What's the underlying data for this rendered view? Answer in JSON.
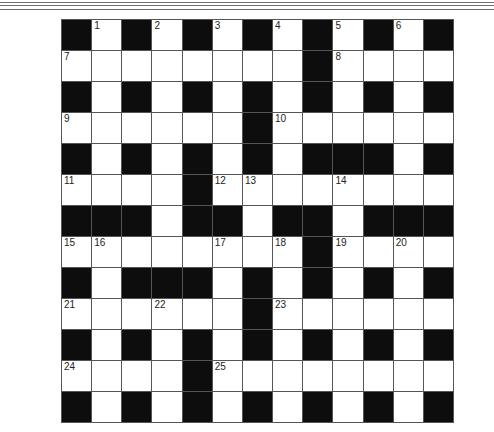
{
  "puzzle": {
    "rows": 13,
    "cols": 13,
    "block_color": "#0d0d0d",
    "cell_color": "#ffffff",
    "line_color": "#555555",
    "layout": [
      "#.#.#.#.#.#.#",
      "........#....",
      "#.#.#.#.#.#.#",
      "......#......",
      "#.#.#.#.###.#",
      "....#........",
      "###.##.##.###",
      "........#....",
      "#.###.#.#.#.#",
      "......#......",
      "#.#.#.#.#.#.#",
      "....#........",
      "#.#.#.#.#.#.#"
    ],
    "numbers": [
      {
        "row": 0,
        "col": 1,
        "n": "1"
      },
      {
        "row": 0,
        "col": 3,
        "n": "2"
      },
      {
        "row": 0,
        "col": 5,
        "n": "3"
      },
      {
        "row": 0,
        "col": 7,
        "n": "4"
      },
      {
        "row": 0,
        "col": 9,
        "n": "5"
      },
      {
        "row": 0,
        "col": 11,
        "n": "6"
      },
      {
        "row": 1,
        "col": 0,
        "n": "7"
      },
      {
        "row": 1,
        "col": 9,
        "n": "8"
      },
      {
        "row": 3,
        "col": 0,
        "n": "9"
      },
      {
        "row": 3,
        "col": 7,
        "n": "10"
      },
      {
        "row": 5,
        "col": 0,
        "n": "11"
      },
      {
        "row": 5,
        "col": 5,
        "n": "12"
      },
      {
        "row": 5,
        "col": 6,
        "n": "13"
      },
      {
        "row": 5,
        "col": 9,
        "n": "14"
      },
      {
        "row": 7,
        "col": 0,
        "n": "15"
      },
      {
        "row": 7,
        "col": 1,
        "n": "16"
      },
      {
        "row": 7,
        "col": 5,
        "n": "17"
      },
      {
        "row": 7,
        "col": 7,
        "n": "18"
      },
      {
        "row": 7,
        "col": 9,
        "n": "19"
      },
      {
        "row": 7,
        "col": 11,
        "n": "20"
      },
      {
        "row": 9,
        "col": 0,
        "n": "21"
      },
      {
        "row": 9,
        "col": 3,
        "n": "22"
      },
      {
        "row": 9,
        "col": 7,
        "n": "23"
      },
      {
        "row": 11,
        "col": 0,
        "n": "24"
      },
      {
        "row": 11,
        "col": 5,
        "n": "25"
      }
    ]
  }
}
